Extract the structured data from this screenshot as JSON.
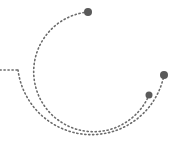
{
  "graphic": {
    "stroke_color": "#6b6b6b",
    "dot_color": "#5a5a5a",
    "background": "#ffffff",
    "inner_arc": {
      "path": "M 88 12 A 60 60 0 1 0 149 95",
      "end_dots": [
        {
          "x": 88,
          "y": 12,
          "r": 4
        },
        {
          "x": 149,
          "y": 95,
          "r": 3.5
        }
      ]
    },
    "outer_arc": {
      "lead_in": "M 0 70 L 18 70",
      "path": "M 18 70 A 74 74 0 0 0 164 75",
      "end_dots": [
        {
          "x": 164,
          "y": 75,
          "r": 4
        }
      ]
    }
  }
}
